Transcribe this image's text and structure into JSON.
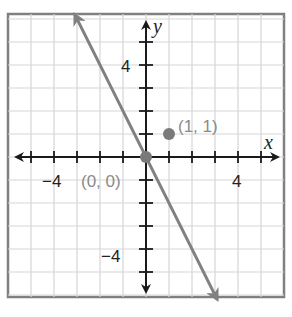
{
  "chart_data": {
    "type": "line",
    "title": "",
    "xlabel": "x",
    "ylabel": "y",
    "xlim": [
      -6,
      6
    ],
    "ylim": [
      -6,
      6
    ],
    "grid": true,
    "x_ticks": [
      -5,
      -4,
      -3,
      -2,
      -1,
      1,
      2,
      3,
      4,
      5
    ],
    "y_ticks": [
      -5,
      -4,
      -3,
      -2,
      -1,
      1,
      2,
      3,
      4,
      5
    ],
    "x_tick_labels": [
      {
        "value": -4,
        "text": "−4"
      },
      {
        "value": 4,
        "text": "4"
      }
    ],
    "y_tick_labels": [
      {
        "value": 4,
        "text": "4"
      },
      {
        "value": -4,
        "text": "−4"
      }
    ],
    "series": [
      {
        "name": "line",
        "equation": "y = -2x",
        "slope": -2,
        "intercept": 0,
        "x": [
          -3.1,
          3.1
        ],
        "y": [
          6.2,
          -6.2
        ],
        "color": "#808080",
        "arrows": "both"
      }
    ],
    "points": [
      {
        "x": 0,
        "y": 0,
        "label": "(0, 0)",
        "label_position": "left-below",
        "color": "#808080"
      },
      {
        "x": 1,
        "y": 1,
        "label": "(1, 1)",
        "label_position": "right",
        "color": "#808080"
      }
    ],
    "colors": {
      "axis": "#1a1a1a",
      "grid": "#d6d6d6",
      "frame": "#808080",
      "line": "#808080",
      "point": "#7a7a7a",
      "point_label": "#8a8a8a"
    }
  }
}
